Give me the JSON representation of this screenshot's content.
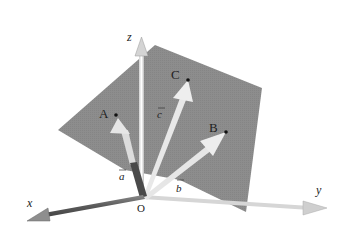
{
  "diagram": {
    "type": "3d-coordinate-system-with-plane",
    "axes": {
      "x_label": "x",
      "y_label": "y",
      "z_label": "z",
      "origin_label": "O"
    },
    "points": [
      {
        "label": "A",
        "x": 116,
        "y": 115
      },
      {
        "label": "B",
        "x": 226,
        "y": 132
      },
      {
        "label": "C",
        "x": 188,
        "y": 80
      }
    ],
    "vectors": [
      {
        "label": "a",
        "name": "vector-a"
      },
      {
        "label": "b",
        "name": "vector-b"
      },
      {
        "label": "c",
        "name": "vector-c"
      }
    ],
    "colors": {
      "plane": "#8a8a8a",
      "axis_x": "#6e6e6e",
      "axis_light": "#d8d8d8",
      "vector_a": "#4a4a4a",
      "vector_arrow": "#e4e4e4",
      "text": "#222222"
    }
  }
}
